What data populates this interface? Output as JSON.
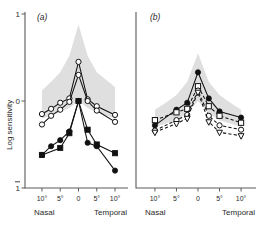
{
  "figure": {
    "width": 263,
    "height": 230,
    "background": "#ffffff",
    "ink_color": "#111111",
    "band_color": "#d9d9d9"
  },
  "axes": {
    "y_label": "Log sensitivity",
    "y_ticks": [
      "1",
      "0",
      "1"
    ],
    "y_tick_values": [
      1,
      0,
      -1
    ],
    "y_top_label": "1",
    "y_mid_label": "0",
    "y_bottom_label": "1",
    "y_bottom_is_negative": true,
    "y_range": [
      -1,
      1
    ],
    "x_ticks": [
      "10°",
      "5°",
      "0",
      "5°",
      "10°"
    ],
    "x_tick_values": [
      -10,
      -5,
      0,
      5,
      10
    ],
    "x_range": [
      -13,
      13
    ],
    "x_left_label": "Nasal",
    "x_right_label": "Temporal",
    "grid": false
  },
  "panels": [
    {
      "id": "a",
      "label": "(a)"
    },
    {
      "id": "b",
      "label": "(b)"
    }
  ],
  "chart_data": [
    {
      "type": "line",
      "panel": "(a)",
      "title": "",
      "xlabel": "",
      "ylabel": "Log sensitivity",
      "xlim": [
        -13,
        13
      ],
      "ylim": [
        -1,
        1
      ],
      "grid": false,
      "legend": "none",
      "x": [
        -10,
        -7.5,
        -5,
        -2.5,
        0,
        2.5,
        5,
        10
      ],
      "normal_band": {
        "label": "normal range",
        "color": "#d9d9d9",
        "upper": [
          0.12,
          0.22,
          0.33,
          0.52,
          0.88,
          0.52,
          0.33,
          0.16
        ],
        "lower": [
          -0.2,
          -0.17,
          -0.13,
          -0.08,
          0.0,
          -0.08,
          -0.13,
          -0.2
        ]
      },
      "series": [
        {
          "name": "open-circle-upper",
          "marker": "open-circle",
          "linestyle": "solid",
          "x": [
            -10,
            -7.5,
            -5,
            -2.5,
            0,
            2.5,
            5,
            10
          ],
          "values": [
            -0.15,
            -0.09,
            -0.02,
            0.03,
            0.45,
            0.02,
            -0.06,
            -0.16
          ]
        },
        {
          "name": "open-circle-lower",
          "marker": "open-circle",
          "linestyle": "solid",
          "x": [
            -10,
            -7.5,
            -5,
            -2.5,
            0,
            2.5,
            5,
            10
          ],
          "values": [
            -0.27,
            -0.17,
            -0.1,
            -0.01,
            0.3,
            0.0,
            -0.11,
            -0.24
          ]
        },
        {
          "name": "filled-circle",
          "marker": "filled-circle",
          "linestyle": "solid",
          "x": [
            -10,
            -7.5,
            -5,
            -2.5,
            0,
            2.5,
            5,
            10
          ],
          "values": [
            -0.62,
            -0.52,
            -0.45,
            -0.35,
            0.0,
            -0.48,
            -0.52,
            -0.8
          ]
        },
        {
          "name": "filled-square",
          "marker": "filled-square",
          "linestyle": "solid",
          "x": [
            -10,
            -5,
            -2.5,
            0,
            2.5,
            5,
            10
          ],
          "values": [
            -0.62,
            -0.54,
            -0.37,
            0.0,
            -0.33,
            -0.5,
            -0.6
          ]
        }
      ]
    },
    {
      "type": "line",
      "panel": "(b)",
      "title": "",
      "xlabel": "",
      "ylabel": "",
      "xlim": [
        -13,
        13
      ],
      "ylim": [
        -1,
        1
      ],
      "grid": false,
      "legend": "none",
      "x": [
        -10,
        -7.5,
        -5,
        -2.5,
        0,
        2.5,
        5,
        7.5,
        10
      ],
      "normal_band": {
        "label": "normal range",
        "color": "#d9d9d9",
        "upper": [
          -0.1,
          -0.02,
          0.07,
          0.22,
          0.55,
          0.22,
          0.07,
          -0.02,
          -0.1
        ],
        "lower": [
          -0.3,
          -0.26,
          -0.22,
          -0.14,
          0.0,
          -0.14,
          -0.22,
          -0.26,
          -0.3
        ]
      },
      "series": [
        {
          "name": "filled-circle",
          "marker": "filled-circle",
          "linestyle": "solid",
          "x": [
            -10,
            -5,
            -2.5,
            0,
            2.5,
            5,
            10
          ],
          "values": [
            -0.28,
            -0.1,
            -0.02,
            0.33,
            0.03,
            -0.12,
            -0.19
          ]
        },
        {
          "name": "open-square",
          "marker": "open-square",
          "linestyle": "dashed",
          "x": [
            -10,
            -5,
            -2.5,
            0,
            2.5,
            5,
            10
          ],
          "values": [
            -0.22,
            -0.13,
            -0.09,
            0.17,
            -0.06,
            -0.17,
            -0.25
          ]
        },
        {
          "name": "open-circle",
          "marker": "open-circle",
          "linestyle": "dashed",
          "x": [
            -10,
            -5,
            -2.5,
            0,
            2.5,
            5,
            10
          ],
          "values": [
            -0.34,
            -0.22,
            -0.16,
            0.12,
            -0.17,
            -0.28,
            -0.33
          ]
        },
        {
          "name": "open-triangle-down",
          "marker": "open-triangle-down",
          "linestyle": "dashed",
          "x": [
            -10,
            -5,
            -2.5,
            0,
            2.5,
            5,
            10
          ],
          "values": [
            -0.36,
            -0.26,
            -0.2,
            0.1,
            -0.24,
            -0.36,
            -0.4
          ]
        }
      ]
    }
  ]
}
